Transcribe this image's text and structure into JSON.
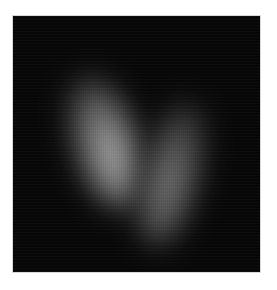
{
  "image": {
    "description": "Grayscale fluorescence-style image with two elongated bright blobs on a black square background",
    "background_color": "#070707",
    "page_background": "#ffffff",
    "blobs": [
      {
        "name": "left",
        "peak_color": "#b4b4b4",
        "orientation": "top tilted left"
      },
      {
        "name": "right",
        "peak_color": "#7e7e7e",
        "orientation": "top tilted right"
      }
    ]
  }
}
